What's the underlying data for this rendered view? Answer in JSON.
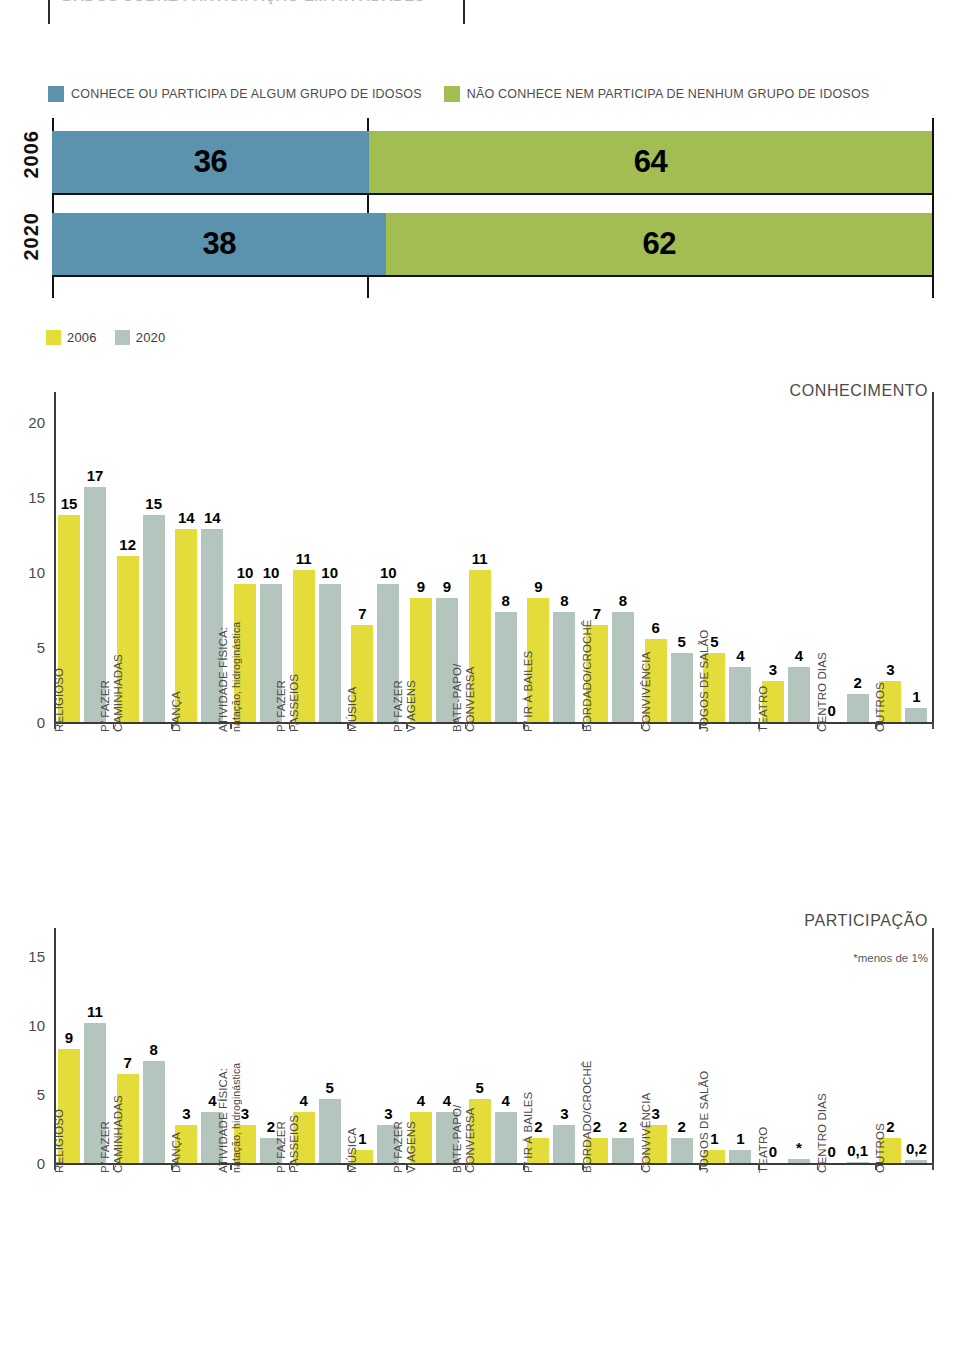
{
  "header": {
    "title_cropped": "DADOS SOBRE PARTICIPAÇÃO EM ATIVIDADES"
  },
  "stacked": {
    "legend": [
      {
        "label": "CONHECE OU PARTICIPA DE ALGUM GRUPO DE IDOSOS",
        "color": "#5b92ad",
        "icon": "legend-swatch-blue"
      },
      {
        "label": "NÃO CONHECE NEM PARTICIPA DE NENHUM GRUPO DE IDOSOS",
        "color": "#a2bd52",
        "icon": "legend-swatch-olive"
      }
    ],
    "rows": [
      {
        "year": "2006",
        "knows": 36,
        "knows_label": "36",
        "not_label": "64",
        "not": 64
      },
      {
        "year": "2020",
        "knows": 38,
        "knows_label": "38",
        "not_label": "62",
        "not": 62
      }
    ]
  },
  "series_legend": [
    {
      "label": "2006",
      "color": "#e3dc3a",
      "icon": "legend-swatch-yellow"
    },
    {
      "label": "2020",
      "color": "#b4c5be",
      "icon": "legend-swatch-graygreen"
    }
  ],
  "chart_data": [
    {
      "id": "conhecimento",
      "type": "bar",
      "title": "CONHECIMENTO",
      "xlabel": "",
      "ylabel": "",
      "ylim": [
        0,
        22
      ],
      "yticks": [
        0,
        5,
        10,
        15,
        20
      ],
      "ytick_labels": [
        "0",
        "5",
        "10",
        "15",
        "20"
      ],
      "grid": false,
      "legend_position": "top-left",
      "categories": [
        "RELIGIOSO",
        "P/ FAZER CAMINHADAS",
        "DANÇA",
        "ATIVIDADE FÍSICA: natação, hidroginástica",
        "P/ FAZER PASSEIOS",
        "MÚSICA",
        "P/ FAZER VIAGENS",
        "BATE-PAPO/ CONVERSA",
        "P/ IR À BAILES",
        "BORDADO/CROCHÊ",
        "CONVIVÊNCIA",
        "JOGOS DE SALÃO",
        "TEATRO",
        "CENTRO DIAS",
        "OUTROS"
      ],
      "category_lines": [
        [
          "RELIGIOSO"
        ],
        [
          "P/ FAZER",
          "CAMINHADAS"
        ],
        [
          "DANÇA"
        ],
        [
          "ATIVIDADE FÍSICA:",
          "natação, hidroginástica"
        ],
        [
          "P/ FAZER",
          "PASSEIOS"
        ],
        [
          "MÚSICA"
        ],
        [
          "P/ FAZER",
          "VIAGENS"
        ],
        [
          "BATE-PAPO/",
          "CONVERSA"
        ],
        [
          "P/ IR À BAILES"
        ],
        [
          "BORDADO/CROCHÊ"
        ],
        [
          "CONVIVÊNCIA"
        ],
        [
          "JOGOS DE SALÃO"
        ],
        [
          "TEATRO"
        ],
        [
          "CENTRO DIAS"
        ],
        [
          "OUTROS"
        ]
      ],
      "series": [
        {
          "name": "2006",
          "color": "#e3dc3a",
          "values": [
            15,
            12,
            14,
            10,
            11,
            7,
            9,
            11,
            9,
            7,
            6,
            5,
            3,
            0,
            3
          ],
          "labels": [
            "15",
            "12",
            "14",
            "10",
            "11",
            "7",
            "9",
            "11",
            "9",
            "7",
            "6",
            "5",
            "3",
            "0",
            "3"
          ]
        },
        {
          "name": "2020",
          "color": "#b4c5be",
          "values": [
            17,
            15,
            14,
            10,
            10,
            10,
            9,
            8,
            8,
            8,
            5,
            4,
            4,
            2,
            1
          ],
          "labels": [
            "17",
            "15",
            "14",
            "10",
            "10",
            "10",
            "9",
            "8",
            "8",
            "8",
            "5",
            "4",
            "4",
            "2",
            "1"
          ]
        }
      ]
    },
    {
      "id": "participacao",
      "type": "bar",
      "title": "PARTICIPAÇÃO",
      "note": "*menos de 1%",
      "xlabel": "",
      "ylabel": "",
      "ylim": [
        0,
        17
      ],
      "yticks": [
        0,
        5,
        10,
        15
      ],
      "ytick_labels": [
        "0",
        "5",
        "10",
        "15"
      ],
      "grid": false,
      "legend_position": "none",
      "categories": [
        "RELIGIOSO",
        "P/ FAZER CAMINHADAS",
        "DANÇA",
        "ATIVIDADE FÍSICA: natação, hidroginástica",
        "P/ FAZER PASSEIOS",
        "MÚSICA",
        "P/ FAZER VIAGENS",
        "BATE-PAPO/ CONVERSA",
        "P/ IR À BAILES",
        "BORDADO/CROCHÊ",
        "CONVIVÊNCIA",
        "JOGOS DE SALÃO",
        "TEATRO",
        "CENTRO DIAS",
        "OUTROS"
      ],
      "category_lines": [
        [
          "RELIGIOSO"
        ],
        [
          "P/ FAZER",
          "CAMINHADAS"
        ],
        [
          "DANÇA"
        ],
        [
          "ATIVIDADE FÍSICA:",
          "natação, hidroginástica"
        ],
        [
          "P/ FAZER",
          "PASSEIOS"
        ],
        [
          "MÚSICA"
        ],
        [
          "P/ FAZER",
          "VIAGENS"
        ],
        [
          "BATE-PAPO/",
          "CONVERSA"
        ],
        [
          "P/ IR À BAILES"
        ],
        [
          "BORDADO/CROCHÊ"
        ],
        [
          "CONVIVÊNCIA"
        ],
        [
          "JOGOS DE SALÃO"
        ],
        [
          "TEATRO"
        ],
        [
          "CENTRO DIAS"
        ],
        [
          "OUTROS"
        ]
      ],
      "series": [
        {
          "name": "2006",
          "color": "#e3dc3a",
          "values": [
            9,
            7,
            3,
            3,
            4,
            1,
            4,
            5,
            2,
            2,
            3,
            1,
            0,
            0,
            2
          ],
          "labels": [
            "9",
            "7",
            "3",
            "3",
            "4",
            "1",
            "4",
            "5",
            "2",
            "2",
            "3",
            "1",
            "0",
            "0",
            "2"
          ]
        },
        {
          "name": "2020",
          "color": "#b4c5be",
          "values": [
            11,
            8,
            4,
            2,
            5,
            3,
            4,
            4,
            3,
            2,
            2,
            1,
            0.3,
            0.1,
            0.2
          ],
          "labels": [
            "11",
            "8",
            "4",
            "2",
            "5",
            "3",
            "4",
            "4",
            "3",
            "2",
            "2",
            "1",
            "*",
            "0,1",
            "0,2"
          ]
        }
      ]
    }
  ]
}
